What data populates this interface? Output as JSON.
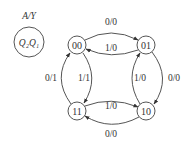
{
  "legend": {
    "title": "A/Y",
    "inner_text": "Q₂Q₁"
  },
  "states": [
    {
      "id": "s00",
      "label": "00"
    },
    {
      "id": "s01",
      "label": "01"
    },
    {
      "id": "s10",
      "label": "10"
    },
    {
      "id": "s11",
      "label": "11"
    }
  ],
  "transitions": [
    {
      "from": "00",
      "to": "01",
      "label": "0/0"
    },
    {
      "from": "01",
      "to": "00",
      "label": "1/0"
    },
    {
      "from": "01",
      "to": "10",
      "label": "0/0"
    },
    {
      "from": "10",
      "to": "01",
      "label": "1/0"
    },
    {
      "from": "10",
      "to": "11",
      "label": "0/0"
    },
    {
      "from": "11",
      "to": "10",
      "label": "1/0"
    },
    {
      "from": "11",
      "to": "00",
      "label": "0/1"
    },
    {
      "from": "00",
      "to": "11",
      "label": "1/1"
    }
  ],
  "colors": {
    "stroke": "#555555",
    "text": "#333333",
    "background": "#ffffff"
  }
}
